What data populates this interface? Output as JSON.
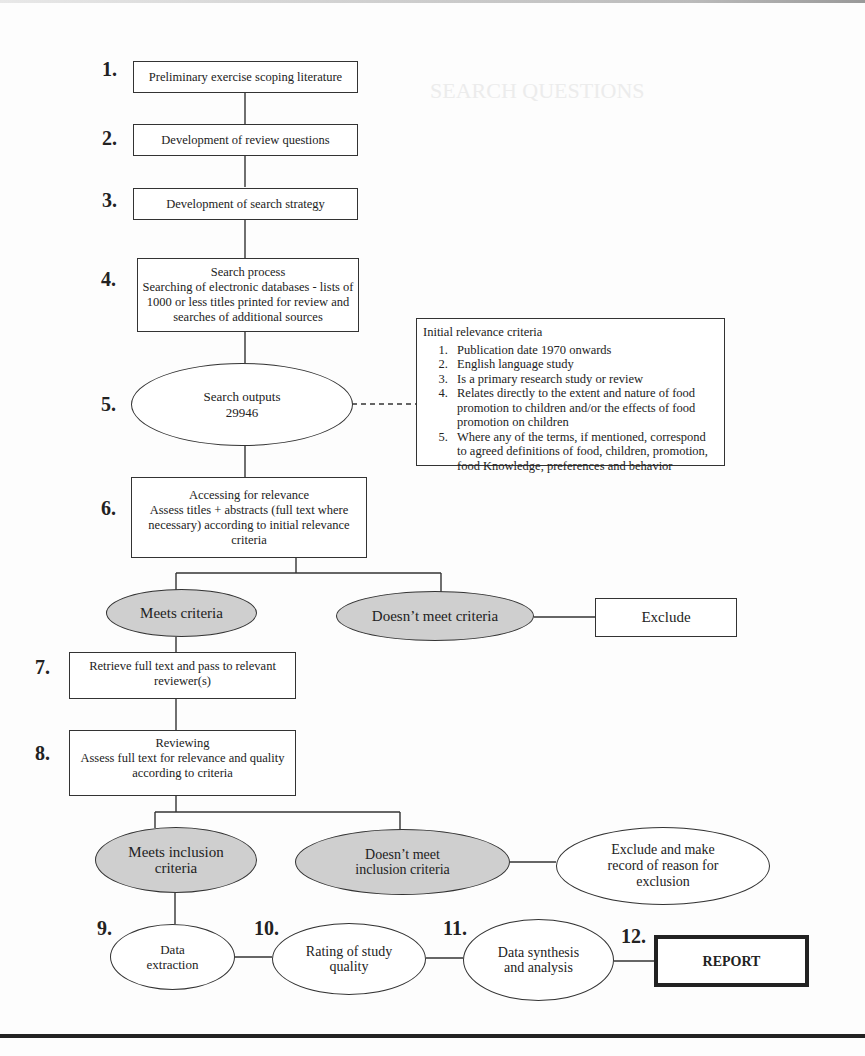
{
  "background_text": {
    "heading_fragment": "SEARCH QUESTIONS"
  },
  "steps": [
    {
      "number": "1.",
      "label": "Preliminary exercise scoping literature"
    },
    {
      "number": "2.",
      "label": "Development of review questions"
    },
    {
      "number": "3.",
      "label": "Development of search strategy"
    },
    {
      "number": "4.",
      "title": "Search process",
      "label": "Searching of electronic databases - lists of 1000 or less titles printed for review and searches of additional sources"
    },
    {
      "number": "5.",
      "title": "Search outputs",
      "label": "29946"
    },
    {
      "number": "6.",
      "title": "Accessing for relevance",
      "label": "Assess titles + abstracts (full text where necessary) according to initial relevance criteria"
    },
    {
      "number": "7.",
      "label": "Retrieve full text and pass to relevant reviewer(s)"
    },
    {
      "number": "8.",
      "title": "Reviewing",
      "label": "Assess full text for relevance and quality according to criteria"
    },
    {
      "number": "9.",
      "label": "Data extraction"
    },
    {
      "number": "10.",
      "label": "Rating of study quality"
    },
    {
      "number": "11.",
      "label": "Data synthesis and analysis"
    },
    {
      "number": "12.",
      "label": "REPORT"
    }
  ],
  "relevance_criteria": {
    "title": "Initial relevance criteria",
    "items": [
      "Publication date 1970 onwards",
      "English language study",
      "Is a primary research study or review",
      "Relates directly to the extent and nature of food promotion to children and/or the effects of food promotion on children",
      "Where any of the terms, if mentioned, correspond to agreed definitions of food, children, promotion, food Knowledge, preferences and behavior"
    ]
  },
  "decisions": {
    "meets_criteria": "Meets criteria",
    "doesnt_meet_criteria": "Doesn’t meet criteria",
    "exclude": "Exclude",
    "meets_inclusion": "Meets inclusion criteria",
    "doesnt_meet_inclusion": "Doesn’t meet inclusion criteria",
    "exclude_record": "Exclude and make record of reason for exclusion"
  },
  "colors": {
    "decision_fill": "#cfcfcf",
    "stroke": "#333333",
    "background": "#fdfdfd"
  }
}
